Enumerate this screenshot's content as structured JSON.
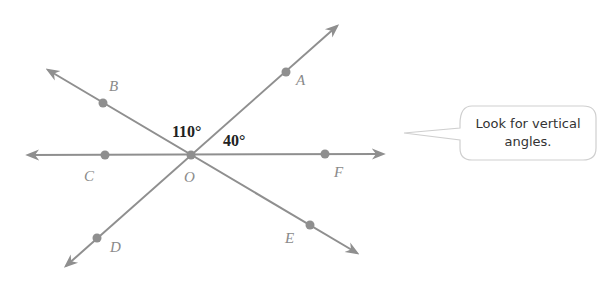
{
  "diagram": {
    "type": "intersecting lines",
    "vertex": {
      "label": "O"
    },
    "points": [
      {
        "label": "A"
      },
      {
        "label": "B"
      },
      {
        "label": "C"
      },
      {
        "label": "D"
      },
      {
        "label": "E"
      },
      {
        "label": "F"
      }
    ],
    "angles": [
      {
        "name": "angle-BOA",
        "value": "110°"
      },
      {
        "name": "angle-AOF",
        "value": "40°"
      }
    ],
    "line_color": "#8f8f8f"
  },
  "callout": {
    "line1": "Look for vertical",
    "line2": "angles."
  }
}
